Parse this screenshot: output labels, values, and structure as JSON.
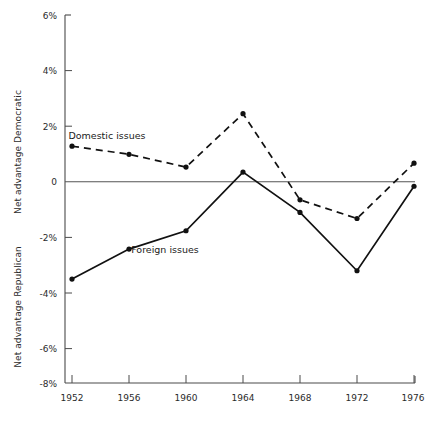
{
  "chart_data": {
    "type": "line",
    "title": "",
    "xlabel": "",
    "ylabel_top": "Net advantage Democratic",
    "ylabel_bottom": "Net advantage Republican",
    "categories": [
      "1952",
      "1956",
      "1960",
      "1964",
      "1968",
      "1972",
      "1976"
    ],
    "x": [
      1952,
      1956,
      1960,
      1964,
      1968,
      1972,
      1976
    ],
    "ylim": [
      -8,
      6
    ],
    "yticks": [
      6,
      4,
      2,
      0,
      -2,
      -4,
      -6,
      -8
    ],
    "ytick_labels": [
      "6%",
      "4%",
      "2%",
      "0",
      "-2%",
      "-4%",
      "-6%",
      "-8%"
    ],
    "grid": false,
    "legend": "inline-annotations",
    "series": [
      {
        "name": "Domestic issues",
        "style": "dashed",
        "values": [
          1.28,
          0.99,
          0.53,
          2.45,
          -0.65,
          -1.32,
          0.67
        ]
      },
      {
        "name": "Foreign issues",
        "style": "solid",
        "values": [
          -3.5,
          -2.42,
          -1.76,
          0.35,
          -1.1,
          -3.2,
          -0.16
        ]
      }
    ],
    "annotations": [
      {
        "text": "Domestic issues",
        "x_px": 107,
        "y_px": 139
      },
      {
        "text": "Foreign issues",
        "x_px": 165,
        "y_px": 253
      }
    ]
  },
  "colors": {
    "ink": "#111111",
    "axis": "#4a4a4a",
    "background": "#ffffff"
  }
}
